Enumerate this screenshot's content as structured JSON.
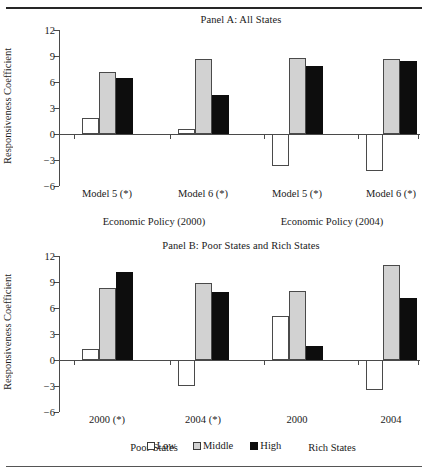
{
  "chart_data": {
    "type": "bar",
    "title": "",
    "legend": {
      "position": "bottom",
      "entries": [
        "Low",
        "Middle",
        "High"
      ]
    },
    "series_colors": {
      "Low": "#ffffff",
      "Middle": "#d2d2d2",
      "High": "#0d0d0d"
    },
    "ylabel": "Responsiveness Coefficient",
    "ylim": [
      -6,
      12
    ],
    "yticks": [
      12,
      9,
      6,
      3,
      0,
      -3,
      -6
    ],
    "ytick_labels": [
      "12",
      "9",
      "6",
      "3",
      "0",
      "−3",
      "−6"
    ],
    "grid": false,
    "panels": [
      {
        "id": "panel-a",
        "title": "Panel A: All States",
        "ylabel": "Responsiveness Coefficient",
        "supergroups": [
          {
            "label": "Economic Policy (2000)"
          },
          {
            "label": "Economic Policy (2004)"
          }
        ],
        "categories": [
          "Model 5 (*)",
          "Model 6 (*)",
          "Model 5 (*)",
          "Model 6 (*)"
        ],
        "series": [
          {
            "name": "Low",
            "values": [
              1.8,
              0.6,
              -3.7,
              -4.3
            ]
          },
          {
            "name": "Middle",
            "values": [
              7.1,
              8.7,
              8.8,
              8.7
            ]
          },
          {
            "name": "High",
            "values": [
              6.5,
              4.5,
              7.9,
              8.4
            ]
          }
        ]
      },
      {
        "id": "panel-b",
        "title": "Panel B: Poor States and Rich States",
        "ylabel": "Responsiveness Coefficient",
        "supergroups": [
          {
            "label": "Poor States"
          },
          {
            "label": "Rich States"
          }
        ],
        "categories": [
          "2000 (*)",
          "2004 (*)",
          "2000",
          "2004"
        ],
        "series": [
          {
            "name": "Low",
            "values": [
              1.3,
              -3.0,
              5.1,
              -3.5
            ]
          },
          {
            "name": "Middle",
            "values": [
              8.3,
              8.9,
              8.0,
              11.0
            ]
          },
          {
            "name": "High",
            "values": [
              10.1,
              7.9,
              1.6,
              7.2
            ]
          }
        ]
      }
    ]
  },
  "panel_a": {
    "title": "Panel A: All States",
    "ylabel": "Responsiveness Coefficient",
    "yticks": {
      "t0": "12",
      "t1": "9",
      "t2": "6",
      "t3": "3",
      "t4": "0",
      "t5": "−3",
      "t6": "−6"
    },
    "categories": {
      "c0": "Model 5 (*)",
      "c1": "Model 6 (*)",
      "c2": "Model 5 (*)",
      "c3": "Model 6 (*)"
    },
    "supergroups": {
      "s0": "Economic Policy (2000)",
      "s1": "Economic Policy (2004)"
    }
  },
  "panel_b": {
    "title": "Panel B: Poor States and Rich States",
    "ylabel": "Responsiveness Coefficient",
    "yticks": {
      "t0": "12",
      "t1": "9",
      "t2": "6",
      "t3": "3",
      "t4": "0",
      "t5": "−3",
      "t6": "−6"
    },
    "categories": {
      "c0": "2000 (*)",
      "c1": "2004 (*)",
      "c2": "2000",
      "c3": "2004"
    },
    "supergroups": {
      "s0": "Poor States",
      "s1": "Rich States"
    }
  },
  "legend": {
    "low": "Low",
    "middle": "Middle",
    "high": "High"
  }
}
